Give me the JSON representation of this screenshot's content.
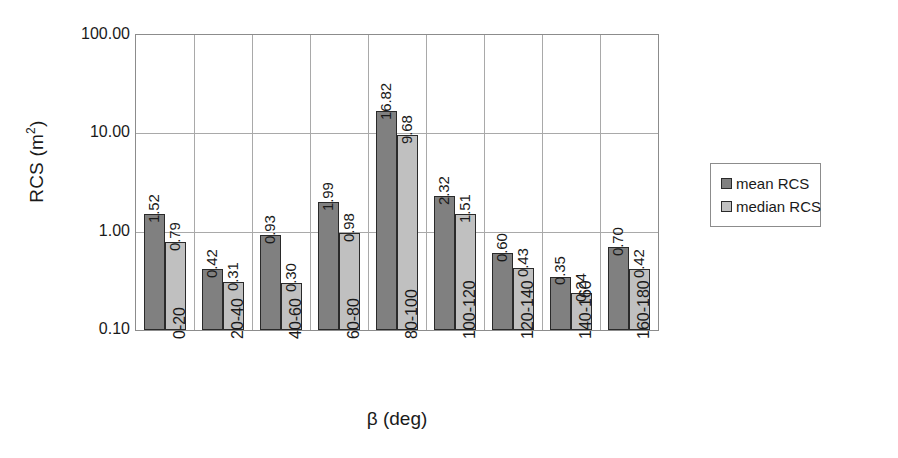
{
  "chart_data": {
    "type": "bar",
    "title": "",
    "xlabel": "β (deg)",
    "ylabel": "RCS (m²)",
    "ylabel_main": "RCS (m",
    "ylabel_sup": "2",
    "ylabel_close": ")",
    "yscale": "log",
    "ylim": [
      0.1,
      100.0
    ],
    "ytick_labels": [
      "100.00",
      "10.00",
      "1.00",
      "0.10"
    ],
    "ytick_values": [
      100.0,
      10.0,
      1.0,
      0.1
    ],
    "grid": "both",
    "legend_position": "right",
    "categories": [
      "0-20",
      "20-40",
      "40-60",
      "60-80",
      "80-100",
      "100-120",
      "120-140",
      "140-160",
      "160-180"
    ],
    "series": [
      {
        "name": "mean RCS",
        "color": "#808080",
        "values": [
          1.52,
          0.42,
          0.93,
          1.99,
          16.82,
          2.32,
          0.6,
          0.35,
          0.7
        ],
        "labels": [
          "1.52",
          "0.42",
          "0.93",
          "1.99",
          "16.82",
          "2.32",
          "0.60",
          "0.35",
          "0.70"
        ]
      },
      {
        "name": "median RCS",
        "color": "#c0c0c0",
        "values": [
          0.79,
          0.31,
          0.3,
          0.98,
          9.68,
          1.51,
          0.43,
          0.24,
          0.42
        ],
        "labels": [
          "0.79",
          "0.31",
          "0.30",
          "0.98",
          "9.68",
          "1.51",
          "0.43",
          "0.24",
          "0.42"
        ]
      }
    ]
  },
  "legend": {
    "entries": [
      {
        "label": "mean RCS",
        "color": "#808080"
      },
      {
        "label": "median RCS",
        "color": "#c0c0c0"
      }
    ]
  },
  "colors": {
    "mean": "#808080",
    "median": "#c0c0c0",
    "axis": "#8c8c8c",
    "grid": "#a9a9a9",
    "bar_outline": "#2a2a2a",
    "text": "#1a1a1a"
  }
}
